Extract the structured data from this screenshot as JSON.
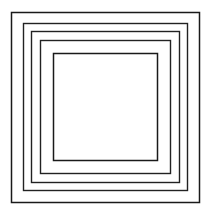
{
  "figure": {
    "canvas": {
      "width": 212,
      "height": 214,
      "background_color": "#ffffff"
    },
    "style": {
      "stroke_color": "#1a1a1a",
      "stroke_color_soft": "#4d4d4d",
      "stroke_width": 1.4,
      "fill": "none",
      "line_join": "miter",
      "shape_count": 5
    },
    "squares": [
      {
        "index": 1,
        "name": "outer-square",
        "x": 11.5,
        "y": 12.5,
        "width": 188,
        "height": 190,
        "stroke_width": 1.5,
        "stroke_color": "#1a1a1a"
      },
      {
        "index": 2,
        "name": "square-2",
        "x": 23.5,
        "y": 23.5,
        "width": 164,
        "height": 167,
        "stroke_width": 1.4,
        "stroke_color": "#222222"
      },
      {
        "index": 3,
        "name": "square-3",
        "x": 31.5,
        "y": 31.5,
        "width": 148,
        "height": 151,
        "stroke_width": 1.4,
        "stroke_color": "#222222"
      },
      {
        "index": 4,
        "name": "square-4",
        "x": 40.5,
        "y": 40.5,
        "width": 130,
        "height": 133,
        "stroke_width": 1.4,
        "stroke_color": "#222222"
      },
      {
        "index": 5,
        "name": "inner-square",
        "x": 53.5,
        "y": 53.5,
        "width": 104,
        "height": 107,
        "stroke_width": 1.5,
        "stroke_color": "#1a1a1a"
      }
    ]
  }
}
